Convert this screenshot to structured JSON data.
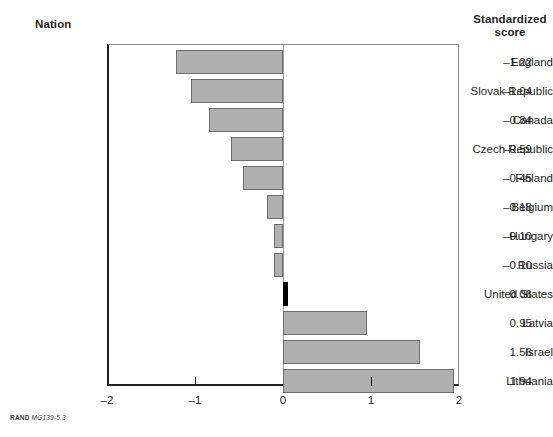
{
  "headers": {
    "nation": "Nation",
    "score_line1": "Standardized",
    "score_line2": "score"
  },
  "footer": {
    "brand": "RAND",
    "code": "MG139-5.3"
  },
  "chart_data": {
    "type": "bar",
    "orientation": "horizontal",
    "title": "",
    "xlabel": "",
    "ylabel": "Nation",
    "xlim": [
      -2,
      2
    ],
    "xticks": [
      -2,
      -1,
      0,
      1,
      2
    ],
    "xtick_labels": [
      "–2",
      "–1",
      "0",
      "1",
      "2"
    ],
    "grid": false,
    "legend": "none",
    "zero_reference_line": true,
    "value_label_column_header": "Standardized score",
    "categories": [
      "England",
      "Slovak Republic",
      "Canada",
      "Czech Republic",
      "Finland",
      "Belgium",
      "Hungary",
      "Russia",
      "United States",
      "Latvia",
      "Israel",
      "Lithuania"
    ],
    "values": [
      -1.22,
      -1.04,
      -0.84,
      -0.59,
      -0.45,
      -0.18,
      -0.1,
      -0.1,
      0.06,
      0.95,
      1.56,
      1.94
    ],
    "value_labels": [
      "–1.22",
      "–1.04",
      "–0.84",
      "–0.59",
      "–0.45",
      "–0.18",
      "–0.10",
      "–0.10",
      "0.06",
      "0.95",
      "1.56",
      "1.94"
    ],
    "highlighted_category": "United States",
    "colors": {
      "bar_fill": "#b0b0b0",
      "bar_border": "#6d6d6d",
      "highlight_fill": "#000000",
      "axis": "#231f20",
      "text": "#231f20"
    }
  }
}
